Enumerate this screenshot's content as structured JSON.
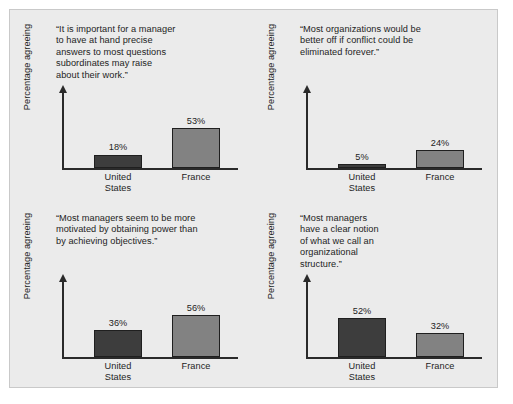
{
  "figure": {
    "background_color": "#ebebeb",
    "border_color": "#c9c9c9",
    "us_bar_color": "#3d3d3d",
    "france_bar_color": "#828282",
    "axis_color": "#2a2a2a"
  },
  "chart_data": [
    {
      "type": "bar",
      "title": "“It is important for a manager\nto have at hand precise\nanswers to most questions\nsubordinates may raise\nabout their work.”",
      "xlabel": "",
      "ylabel": "Percentage agreeing",
      "categories": [
        "United\nStates",
        "France"
      ],
      "values": [
        18,
        53
      ],
      "value_labels": [
        "18%",
        "53%"
      ],
      "ylim": [
        0,
        100
      ],
      "grid": false,
      "legend": "none"
    },
    {
      "type": "bar",
      "title": "“Most organizations would be\nbetter off if conflict could be\neliminated forever.”",
      "xlabel": "",
      "ylabel": "Percentage agreeing",
      "categories": [
        "United\nStates",
        "France"
      ],
      "values": [
        5,
        24
      ],
      "value_labels": [
        "5%",
        "24%"
      ],
      "ylim": [
        0,
        100
      ],
      "grid": false,
      "legend": "none"
    },
    {
      "type": "bar",
      "title": "“Most managers seem to be more\nmotivated by obtaining power than\nby achieving objectives.”",
      "xlabel": "",
      "ylabel": "Percentage agreeing",
      "categories": [
        "United\nStates",
        "France"
      ],
      "values": [
        36,
        56
      ],
      "value_labels": [
        "36%",
        "56%"
      ],
      "ylim": [
        0,
        100
      ],
      "grid": false,
      "legend": "none"
    },
    {
      "type": "bar",
      "title": "“Most managers\nhave a clear notion\nof what we call an\norganizational\nstructure.”",
      "xlabel": "",
      "ylabel": "Percentage agreeing",
      "categories": [
        "United\nStates",
        "France"
      ],
      "values": [
        52,
        32
      ],
      "value_labels": [
        "52%",
        "32%"
      ],
      "ylim": [
        0,
        100
      ],
      "grid": false,
      "legend": "none"
    }
  ]
}
